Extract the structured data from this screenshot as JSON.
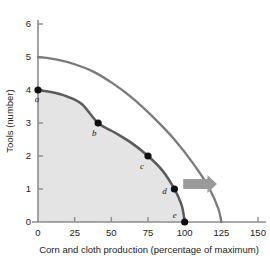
{
  "chart_data": {
    "type": "line",
    "title": "",
    "xlabel": "Corn and cloth production (percentage of maximum)",
    "ylabel": "Tools (number)",
    "xlim": [
      0,
      160
    ],
    "ylim": [
      0,
      6
    ],
    "grid": false,
    "legend": "none",
    "xticks": [
      0,
      25,
      50,
      75,
      100,
      125,
      150
    ],
    "xtick_labels": [
      "0",
      "25",
      "50",
      "75",
      "100",
      "125",
      "150"
    ],
    "yticks": [
      0,
      1,
      2,
      3,
      4,
      5,
      6
    ],
    "ytick_labels": [
      "0",
      "1",
      "2",
      "3",
      "4",
      "5",
      "6"
    ],
    "series": [
      {
        "name": "Current production possibilities frontier",
        "style": "curve",
        "color": "#5a5a5a",
        "x": [
          0,
          10,
          20,
          30,
          41,
          52,
          63,
          75,
          85,
          93,
          98,
          100
        ],
        "y": [
          4.0,
          3.93,
          3.8,
          3.57,
          3.0,
          2.72,
          2.42,
          2.0,
          1.55,
          1.0,
          0.5,
          0.0
        ]
      },
      {
        "name": "Expanded production possibilities frontier",
        "style": "curve",
        "color": "#7a7a7a",
        "x": [
          0,
          13,
          25,
          38,
          51,
          64,
          78,
          93,
          107,
          117,
          123,
          125
        ],
        "y": [
          5.0,
          4.92,
          4.78,
          4.55,
          4.2,
          3.77,
          3.2,
          2.5,
          1.7,
          1.0,
          0.4,
          0.0
        ]
      }
    ],
    "points": [
      {
        "label": "a",
        "x": 0,
        "y": 4,
        "label_dx": -1,
        "label_dy": 12
      },
      {
        "label": "b",
        "x": 41,
        "y": 3,
        "label_dx": -4,
        "label_dy": 13
      },
      {
        "label": "c",
        "x": 75,
        "y": 2,
        "label_dx": -6,
        "label_dy": 13
      },
      {
        "label": "d",
        "x": 93,
        "y": 1,
        "label_dx": -10,
        "label_dy": 5
      },
      {
        "label": "e",
        "x": 100,
        "y": 0,
        "label_dx": -10,
        "label_dy": -4
      }
    ],
    "annotations": [
      {
        "name": "growth-arrow",
        "type": "arrow",
        "direction": "right",
        "color": "#9a9a9a",
        "from_x": 99,
        "from_y": 1.15,
        "to_x": 122,
        "to_y": 1.15
      }
    ],
    "shaded_region": {
      "name": "attainable-production-area",
      "color": "#e4e4e4",
      "description": "Area under the current production possibilities frontier"
    },
    "colors": {
      "axis": "#8c8c8c",
      "inner_curve": "#5a5a5a",
      "outer_curve": "#7a7a7a",
      "point_marker": "#101010",
      "shade": "#e4e4e4",
      "arrow": "#9a9a9a",
      "text": "#1a1a1a",
      "background": "#ffffff"
    }
  }
}
